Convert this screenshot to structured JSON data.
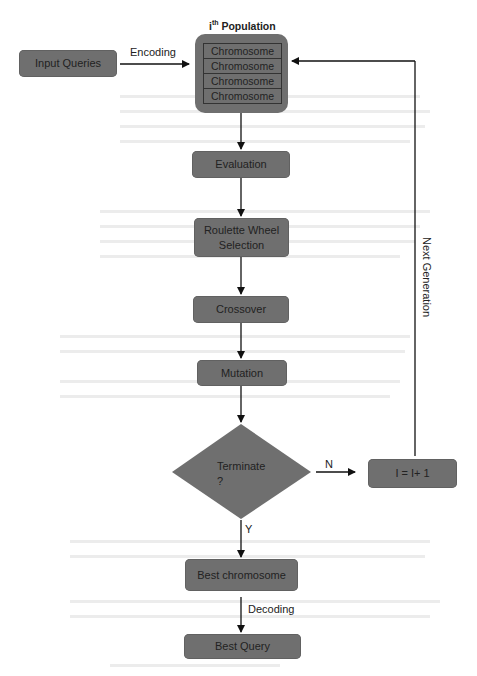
{
  "diagram": {
    "type": "flowchart",
    "title_population": {
      "prefix": "i",
      "superscript": "th",
      "suffix": " Population"
    },
    "nodes": {
      "input_queries": "Input Queries",
      "population_chromosomes": [
        "Chromosome",
        "Chromosome",
        "Chromosome",
        "Chromosome"
      ],
      "evaluation": "Evaluation",
      "selection": [
        "Roulette Wheel",
        "Selection"
      ],
      "crossover": "Crossover",
      "mutation": "Mutation",
      "terminate": [
        "Terminate",
        "?"
      ],
      "increment": "I = I+ 1",
      "best_chromosome": "Best chromosome",
      "best_query": "Best Query"
    },
    "edge_labels": {
      "encoding": "Encoding",
      "no": "N",
      "yes": "Y",
      "next_generation": "Next Generation",
      "decoding": "Decoding"
    },
    "colors": {
      "node_fill": "#6f6f6f",
      "line": "#111111",
      "background": "#ffffff"
    }
  }
}
